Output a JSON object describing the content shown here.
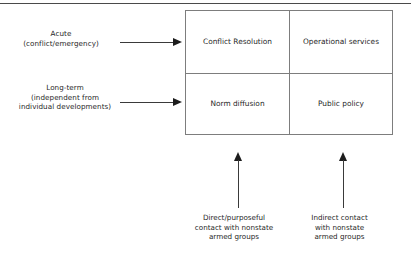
{
  "diagram": {
    "top_rule": true,
    "axis_labels": [
      {
        "id": "acute",
        "lines": [
          "Acute",
          "(conflict/emergency)"
        ]
      },
      {
        "id": "long-term",
        "lines": [
          "Long-term",
          "(independent from",
          "individual developments)"
        ]
      }
    ],
    "matrix": {
      "rows": [
        {
          "row_label_ref": "acute",
          "cells": [
            {
              "id": "conflict-resolution",
              "label": "Conflict Resolution"
            },
            {
              "id": "operational-services",
              "label": "Operational services"
            }
          ]
        },
        {
          "row_label_ref": "long-term",
          "cells": [
            {
              "id": "norm-diffusion",
              "label": "Norm diffusion"
            },
            {
              "id": "public-policy",
              "label": "Public policy"
            }
          ]
        }
      ]
    },
    "column_captions": [
      {
        "id": "direct",
        "lines": [
          "Direct/purposeful",
          "contact with nonstate",
          "armed groups"
        ]
      },
      {
        "id": "indirect",
        "lines": [
          "Indirect contact",
          "with nonstate",
          "armed groups"
        ]
      }
    ],
    "colors": {
      "background": "#ffffff",
      "text": "#1f1f1f",
      "box_border": "#7d7d7d",
      "arrow": "#1c1c1c",
      "rule": "#4a4a4a"
    }
  }
}
